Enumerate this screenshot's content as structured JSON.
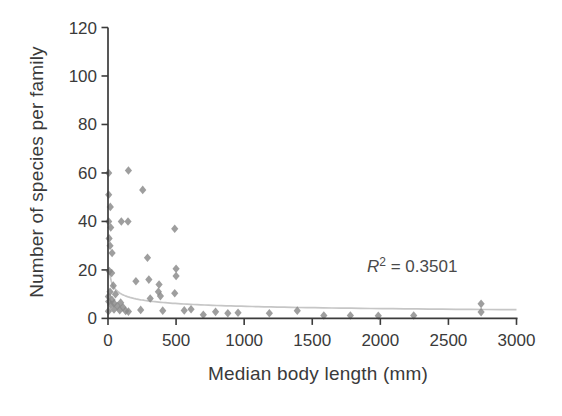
{
  "figure": {
    "colors": {
      "marker": "#898989",
      "trendline": "#c6c6c6",
      "axis": "#3b3b3b",
      "text": "#3a3a3a",
      "background": "#ffffff"
    },
    "annotation": {
      "r": "R",
      "exp": "2",
      "rest": " = 0.3501"
    }
  },
  "chart_data": {
    "type": "scatter",
    "title": "",
    "xlabel": "Median body length (mm)",
    "ylabel": "Number of species per family",
    "xlim": [
      0,
      3000
    ],
    "ylim": [
      0,
      120
    ],
    "xticks": [
      0,
      500,
      1000,
      1500,
      2000,
      2500,
      3000
    ],
    "yticks": [
      0,
      20,
      40,
      60,
      80,
      100,
      120
    ],
    "grid": false,
    "legend": "none",
    "marker_shape": "diamond",
    "annotations": [
      {
        "text": "R^2 = 0.3501",
        "x": 2300,
        "y": 22
      }
    ],
    "trendline": {
      "kind": "power",
      "a": 40.2,
      "b": -0.302,
      "x_start": 11,
      "x_end": 3000,
      "r_squared": 0.3501
    },
    "points": [
      [
        5,
        60
      ],
      [
        150,
        61
      ],
      [
        255,
        53
      ],
      [
        5,
        51
      ],
      [
        17,
        46
      ],
      [
        5,
        40
      ],
      [
        98,
        40
      ],
      [
        147,
        40
      ],
      [
        490,
        37
      ],
      [
        20,
        37.5
      ],
      [
        8,
        33
      ],
      [
        15,
        30
      ],
      [
        30,
        27
      ],
      [
        290,
        25
      ],
      [
        500,
        20.5
      ],
      [
        10,
        19.5
      ],
      [
        27,
        18.7
      ],
      [
        500,
        17.5
      ],
      [
        205,
        15.3
      ],
      [
        300,
        16
      ],
      [
        375,
        14
      ],
      [
        39,
        13.5
      ],
      [
        15,
        11
      ],
      [
        370,
        11
      ],
      [
        490,
        10.4
      ],
      [
        55,
        10
      ],
      [
        310,
        8.2
      ],
      [
        385,
        9.2
      ],
      [
        3,
        9
      ],
      [
        30,
        7.6
      ],
      [
        5,
        7
      ],
      [
        93,
        6.5
      ],
      [
        44,
        6.2
      ],
      [
        2740,
        6
      ],
      [
        20,
        5.5
      ],
      [
        68,
        5.1
      ],
      [
        110,
        4.6
      ],
      [
        44,
        3.7
      ],
      [
        86,
        3.4
      ],
      [
        130,
        3.1
      ],
      [
        3,
        3
      ],
      [
        240,
        3.5
      ],
      [
        150,
        2.8
      ],
      [
        402,
        3.2
      ],
      [
        560,
        3.3
      ],
      [
        610,
        3.8
      ],
      [
        700,
        1.5
      ],
      [
        790,
        2.7
      ],
      [
        880,
        2.1
      ],
      [
        955,
        2.3
      ],
      [
        1185,
        2.1
      ],
      [
        1390,
        3.2
      ],
      [
        1585,
        1.2
      ],
      [
        1780,
        1.2
      ],
      [
        1985,
        1.1
      ],
      [
        2245,
        1.2
      ],
      [
        2740,
        2.6
      ]
    ]
  }
}
